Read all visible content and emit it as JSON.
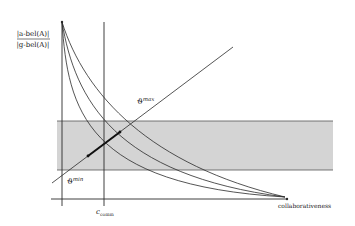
{
  "diagram": {
    "y_axis_label_numerator": "|a-bel(A)|",
    "y_axis_label_denominator": "|g-bel(A)|",
    "x_axis_label": "collaborativeness",
    "vline_label_main": "c",
    "vline_label_sub": "comm",
    "upper_line_label_main": "ϑ",
    "upper_line_label_sup": "max",
    "lower_line_label_main": "ϑ",
    "lower_line_label_sup": "min",
    "colors": {
      "line": "#2a2a2a",
      "band_fill": "#d4d4d4",
      "band_edge": "#555555",
      "background": "#ffffff"
    },
    "curves": [
      {
        "name": "curve-1"
      },
      {
        "name": "curve-2"
      },
      {
        "name": "curve-3"
      }
    ]
  }
}
